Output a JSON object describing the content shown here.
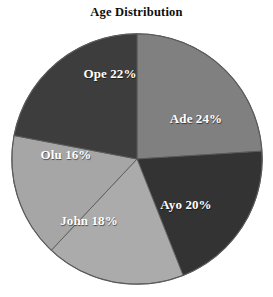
{
  "chart_data": {
    "type": "pie",
    "title": "Age Distribution",
    "xlabel": "",
    "ylabel": "",
    "legend": "none",
    "grid": false,
    "start_angle_deg": 0,
    "direction": "clockwise",
    "categories": [
      "Ade",
      "Ayo",
      "John",
      "Olu",
      "Ope"
    ],
    "values": [
      24,
      20,
      18,
      16,
      22
    ],
    "labels": [
      "Ade 24%",
      "Ayo 20%",
      "John 18%",
      "Olu 16%",
      "Ope 22%"
    ],
    "value_suffix": "%",
    "slices": [
      {
        "name": "Ade",
        "value": 24,
        "label": "Ade 24%",
        "color": "#808080",
        "label_x": 196,
        "label_y": 119
      },
      {
        "name": "Ayo",
        "value": 20,
        "label": "Ayo 20%",
        "color": "#333333",
        "label_x": 186,
        "label_y": 205
      },
      {
        "name": "John",
        "value": 18,
        "label": "John 18%",
        "color": "#ababab",
        "label_x": 89,
        "label_y": 221
      },
      {
        "name": "Olu",
        "value": 16,
        "label": "Olu 16%",
        "color": "#a6a6a6",
        "label_x": 66,
        "label_y": 155
      },
      {
        "name": "Ope",
        "value": 22,
        "label": "Ope 22%",
        "color": "#3d3d3d",
        "label_x": 110,
        "label_y": 74
      }
    ],
    "colors": {
      "background": "#ffffff",
      "label_text": "#ffffff",
      "title_text": "#0d0d0d",
      "outline": "#5a5a5a"
    }
  }
}
